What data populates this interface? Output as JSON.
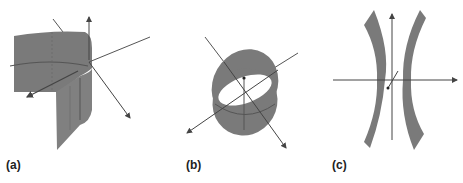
{
  "figure": {
    "panels": [
      {
        "id": "a",
        "label": "(a)",
        "description": "cylindrical surface section with 3D axes (x, y, z arrows)"
      },
      {
        "id": "b",
        "label": "(b)",
        "description": "elliptic cylinder band with 3D axes"
      },
      {
        "id": "c",
        "label": "(c)",
        "description": "hyperbolic cylinder (two curved sheets) with 3D axes"
      }
    ],
    "colors": {
      "surface_fill": "#7a7a7a",
      "surface_edge": "#5e5e5e",
      "axis_line": "#555555",
      "background": "#ffffff"
    }
  }
}
